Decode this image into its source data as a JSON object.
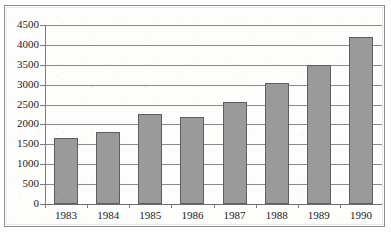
{
  "chart_data": {
    "type": "bar",
    "title": "",
    "subtitle": "",
    "xlabel": "",
    "ylabel": "",
    "categories": [
      "1983",
      "1984",
      "1985",
      "1986",
      "1987",
      "1988",
      "1989",
      "1990"
    ],
    "values": [
      1650,
      1820,
      2270,
      2200,
      2560,
      3050,
      3490,
      4200
    ],
    "ylim": [
      0,
      4500
    ],
    "ytick_step": 500,
    "yticks": [
      "0",
      "500",
      "1000",
      "1500",
      "2000",
      "2500",
      "3000",
      "3500",
      "4000",
      "4500"
    ],
    "ytick_values": [
      0,
      500,
      1000,
      1500,
      2000,
      2500,
      3000,
      3500,
      4000,
      4500
    ],
    "grid": true,
    "grid_axis": "y",
    "legend": false,
    "legend_entries": [],
    "annotations": [],
    "bar_fill_color": "#9a9a9a",
    "bar_border_color": "#5d5d5d",
    "gridline_color": "#8a8a8a",
    "axis_color": "#7a7a7a",
    "frame_color": "#8d8d8d",
    "background_color": "#fdfdfc",
    "text_color": "#1b1b1b"
  }
}
